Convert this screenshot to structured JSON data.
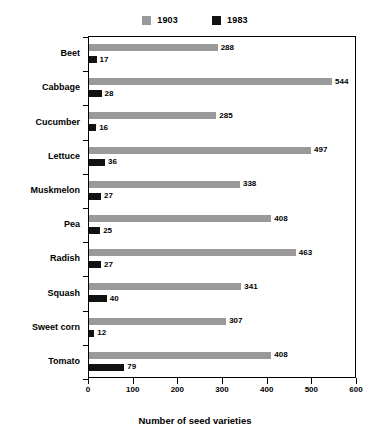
{
  "chart_data": {
    "type": "bar",
    "orientation": "horizontal",
    "title": "",
    "xlabel": "Number of seed varieties",
    "ylabel": "",
    "xlim": [
      0,
      600
    ],
    "xticks": [
      0,
      100,
      200,
      300,
      400,
      500,
      600
    ],
    "grid": false,
    "legend_position": "top-center",
    "categories": [
      "Beet",
      "Cabbage",
      "Cucumber",
      "Lettuce",
      "Muskmelon",
      "Pea",
      "Radish",
      "Squash",
      "Sweet corn",
      "Tomato"
    ],
    "series": [
      {
        "name": "1903",
        "color": "#9a9a9a",
        "values": [
          288,
          544,
          285,
          497,
          338,
          408,
          463,
          341,
          307,
          408
        ]
      },
      {
        "name": "1983",
        "color": "#121212",
        "values": [
          17,
          28,
          16,
          36,
          27,
          25,
          27,
          40,
          12,
          79
        ]
      }
    ]
  },
  "legend": {
    "items": [
      {
        "label": "1903",
        "color": "#9a9a9a"
      },
      {
        "label": "1983",
        "color": "#121212"
      }
    ]
  },
  "axis": {
    "x_title": "Number of seed varieties",
    "x_tick_labels": [
      "0",
      "100",
      "200",
      "300",
      "400",
      "500",
      "600"
    ]
  }
}
